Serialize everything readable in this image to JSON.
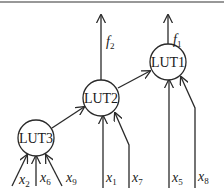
{
  "diagram": {
    "type": "LUT network",
    "nodes": [
      {
        "id": "lut1",
        "label": "LUT1"
      },
      {
        "id": "lut2",
        "label": "LUT2"
      },
      {
        "id": "lut3",
        "label": "LUT3"
      }
    ],
    "outputs": [
      {
        "from": "lut2",
        "var": "f",
        "sub": "2"
      },
      {
        "from": "lut1",
        "var": "f",
        "sub": "1"
      }
    ],
    "inputs": [
      {
        "to": "lut3",
        "var": "x",
        "sub": "2"
      },
      {
        "to": "lut3",
        "var": "x",
        "sub": "6"
      },
      {
        "to": "lut3",
        "var": "x",
        "sub": "9"
      },
      {
        "to": "lut2",
        "var": "x",
        "sub": "1"
      },
      {
        "to": "lut2",
        "var": "x",
        "sub": "7"
      },
      {
        "to": "lut1",
        "var": "x",
        "sub": "5"
      },
      {
        "to": "lut1",
        "var": "x",
        "sub": "8"
      }
    ],
    "edges": [
      {
        "from": "lut3",
        "to": "lut2"
      },
      {
        "from": "lut2",
        "to": "lut1"
      }
    ]
  }
}
